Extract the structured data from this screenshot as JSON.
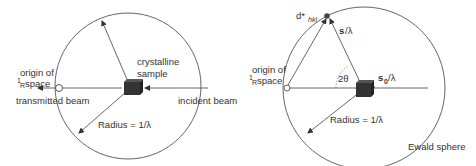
{
  "left_diagram": {
    "labels": {
      "crystalline": "crystalline",
      "sample": "sample",
      "origin_line1": "origin of",
      "origin_frac": "1",
      "origin_frac_den": "R",
      "origin_space": " space",
      "transmitted_beam": "transmitted beam",
      "incident_beam": "incident beam",
      "radius": "Radius = 1/λ"
    }
  },
  "right_diagram": {
    "labels": {
      "d_star": "d*",
      "hkl": "hkl",
      "s_lambda_s": "s",
      "s_lambda_rest": "/λ",
      "s0": "s",
      "s0_sub": "0",
      "s0_rest": "/λ",
      "two_theta": "2θ",
      "origin_line1": "origin of",
      "origin_frac": "1",
      "origin_frac_den": "R",
      "origin_space": " space",
      "radius": "Radius = 1/λ",
      "ewald_sphere": "Ewald sphere"
    }
  },
  "colors": {
    "line": "#444444",
    "cube": "#3a3a3a",
    "text": "#333333"
  }
}
